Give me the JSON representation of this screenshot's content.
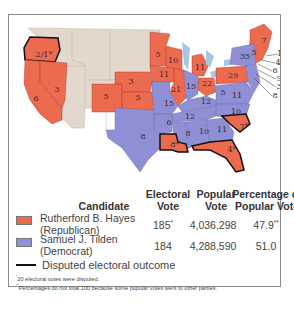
{
  "colors": {
    "republican": "#ec6a4e",
    "democrat": "#8f8fd6",
    "territory": "#e2d8cc",
    "water": "#a9c5e6",
    "disputed_border": "#111111"
  },
  "map": {
    "state_labels": [
      {
        "label": "2/1*",
        "x": 34,
        "y": 35
      },
      {
        "label": "6",
        "x": 26,
        "y": 79
      },
      {
        "label": "3",
        "x": 47,
        "y": 70
      },
      {
        "label": "5",
        "x": 96,
        "y": 77
      },
      {
        "label": "3",
        "x": 121,
        "y": 62
      },
      {
        "label": "5",
        "x": 128,
        "y": 78
      },
      {
        "label": "5",
        "x": 148,
        "y": 35
      },
      {
        "label": "10",
        "x": 163,
        "y": 41
      },
      {
        "label": "11",
        "x": 154,
        "y": 55
      },
      {
        "label": "21",
        "x": 166,
        "y": 70
      },
      {
        "label": "11",
        "x": 190,
        "y": 48
      },
      {
        "label": "15",
        "x": 159,
        "y": 84
      },
      {
        "label": "15",
        "x": 181,
        "y": 67
      },
      {
        "label": "22",
        "x": 197,
        "y": 64
      },
      {
        "label": "29",
        "x": 223,
        "y": 56
      },
      {
        "label": "35",
        "x": 235,
        "y": 37
      },
      {
        "label": "5",
        "x": 213,
        "y": 73
      },
      {
        "label": "11",
        "x": 227,
        "y": 76
      },
      {
        "label": "12",
        "x": 196,
        "y": 82
      },
      {
        "label": "10",
        "x": 226,
        "y": 92
      },
      {
        "label": "12",
        "x": 180,
        "y": 97
      },
      {
        "label": "6",
        "x": 159,
        "y": 103
      },
      {
        "label": "8",
        "x": 178,
        "y": 114
      },
      {
        "label": "10",
        "x": 194,
        "y": 112
      },
      {
        "label": "11",
        "x": 212,
        "y": 110
      },
      {
        "label": "7*",
        "x": 234,
        "y": 107
      },
      {
        "label": "8",
        "x": 133,
        "y": 117
      },
      {
        "label": "8*",
        "x": 165,
        "y": 125
      },
      {
        "label": "4*",
        "x": 222,
        "y": 130
      },
      {
        "label": "7",
        "x": 254,
        "y": 21
      },
      {
        "label": "5",
        "x": 244,
        "y": 33
      }
    ],
    "callouts": [
      {
        "label": "13",
        "x": 272,
        "y": 34
      },
      {
        "label": "4",
        "x": 268,
        "y": 43
      },
      {
        "label": "6",
        "x": 265,
        "y": 51
      },
      {
        "label": "9",
        "x": 269,
        "y": 59
      },
      {
        "label": "3",
        "x": 269,
        "y": 67
      },
      {
        "label": "8",
        "x": 265,
        "y": 76
      }
    ]
  },
  "legend": {
    "headers": {
      "candidate": "Candidate",
      "electoral_1": "Electoral",
      "electoral_2": "Vote",
      "popular_1": "Popular",
      "popular_2": "Vote",
      "percentage_1": "Percentage of",
      "percentage_2": "Popular Vote"
    },
    "rows": [
      {
        "name": "Rutherford B. Hayes",
        "party": "(Republican)",
        "electoral": "185",
        "electoral_mark": "*",
        "popular": "4,036,298",
        "percentage": "47.9",
        "percentage_mark": "**"
      },
      {
        "name": "Samuel J. Tilden",
        "party": "(Democrat)",
        "electoral": "184",
        "electoral_mark": "",
        "popular": "4,288,590",
        "percentage": "51.0",
        "percentage_mark": ""
      }
    ],
    "disputed_label": "Disputed electoral outcome"
  },
  "footnotes": {
    "note1_mark": "*",
    "note1": "20 electoral votes were disputed.",
    "note2_mark": "**",
    "note2": "Percentages do not total 100 because some popular votes went to other parties."
  }
}
